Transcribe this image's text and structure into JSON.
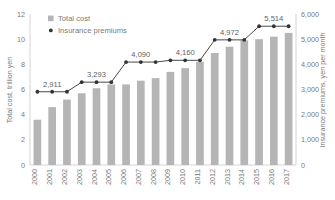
{
  "chart_data": {
    "type": "bar",
    "title": "",
    "subtitle": "",
    "categories": [
      "2000",
      "2001",
      "2002",
      "2003",
      "2004",
      "2005",
      "2006",
      "2007",
      "2008",
      "2009",
      "2010",
      "2011",
      "2012",
      "2013",
      "2014",
      "2015",
      "2016",
      "2017"
    ],
    "series": [
      {
        "name": "Total cost",
        "type": "bar",
        "axis": "left",
        "color": "#b5b5b5",
        "unit": "trillion yen",
        "values": [
          3.6,
          4.6,
          5.2,
          5.7,
          6.1,
          6.4,
          6.4,
          6.7,
          6.9,
          7.4,
          7.7,
          8.2,
          8.9,
          9.4,
          9.9,
          10.0,
          10.2,
          10.5
        ]
      },
      {
        "name": "Insurance premiums",
        "type": "line",
        "axis": "right",
        "color": "#333333",
        "unit": "yen per month",
        "values": [
          2911,
          2911,
          2911,
          3293,
          3293,
          3293,
          4090,
          4090,
          4090,
          4160,
          4160,
          4160,
          4972,
          4972,
          4972,
          5514,
          5514,
          5514
        ]
      }
    ],
    "point_labels": [
      {
        "category": "2001",
        "value": 2911,
        "text": "2,911"
      },
      {
        "category": "2004",
        "value": 3293,
        "text": "3,293"
      },
      {
        "category": "2007",
        "value": 4090,
        "text": "4,090"
      },
      {
        "category": "2010",
        "value": 4160,
        "text": "4,160"
      },
      {
        "category": "2013",
        "value": 4972,
        "text": "4,972"
      },
      {
        "category": "2016",
        "value": 5514,
        "text": "5,514"
      }
    ],
    "xlabel": "",
    "ylabel": "Total cost, trillion yen",
    "y2label": "Insurance premiums, yen per month",
    "ylim": [
      0,
      12
    ],
    "y2lim": [
      0,
      6000
    ],
    "yticks": [
      "0",
      "2",
      "4",
      "6",
      "8",
      "10",
      "12"
    ],
    "ytick_values": [
      0,
      2,
      4,
      6,
      8,
      10,
      12
    ],
    "y2ticks": [
      "0",
      "1,000",
      "2,000",
      "3,000",
      "4,000",
      "5,000",
      "6,000"
    ],
    "y2tick_values": [
      0,
      1000,
      2000,
      3000,
      4000,
      5000,
      6000
    ],
    "grid": false,
    "legend_position": "top-left",
    "legend": [
      {
        "label": "Total cost",
        "marker": "square",
        "color": "#b5b5b5"
      },
      {
        "label": "Insurance premiums",
        "marker": "circle",
        "color": "#333333"
      }
    ]
  }
}
